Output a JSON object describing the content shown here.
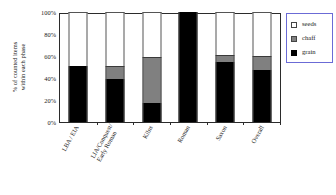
{
  "chart_data": {
    "type": "bar",
    "stacked": true,
    "title": "",
    "xlabel": "",
    "ylabel": "% of counted items within each phase",
    "ylabel_lines": [
      "% of counted items",
      "within each phase"
    ],
    "ylim": [
      0,
      100
    ],
    "ytick_labels": [
      "0%",
      "20%",
      "40%",
      "60%",
      "80%",
      "100%"
    ],
    "ytick_values": [
      0,
      20,
      40,
      60,
      80,
      100
    ],
    "grid": false,
    "legend_position": "right",
    "categories": [
      "LBA / EIA",
      "LIA/Conquest/ Early Roman",
      "Kilns",
      "Roman",
      "Saxon",
      "Overall"
    ],
    "category_lines": [
      [
        "LBA / EIA"
      ],
      [
        "LIA/Conquest/",
        "Early Roman"
      ],
      [
        "Kilns"
      ],
      [
        "Roman"
      ],
      [
        "Saxon"
      ],
      [
        "Overall"
      ]
    ],
    "series": [
      {
        "name": "grain",
        "color": "#000000",
        "values": [
          51,
          39,
          17,
          100,
          55,
          47
        ]
      },
      {
        "name": "chaff",
        "color": "#808080",
        "values": [
          0,
          12,
          42,
          0,
          6,
          13
        ]
      },
      {
        "name": "seeds",
        "color": "#ffffff",
        "values": [
          49,
          49,
          41,
          0,
          39,
          40
        ]
      }
    ]
  },
  "legend": {
    "items": [
      {
        "label": "seeds",
        "swatch": "legend-swatch-seeds"
      },
      {
        "label": "chaff",
        "swatch": "legend-swatch-chaff"
      },
      {
        "label": "grain",
        "swatch": "legend-swatch-grain"
      }
    ]
  },
  "colors": {
    "grain": "#000000",
    "chaff": "#808080",
    "seeds": "#ffffff",
    "axis": "#2b2b2b",
    "legend_border": "#6b6bd6"
  }
}
